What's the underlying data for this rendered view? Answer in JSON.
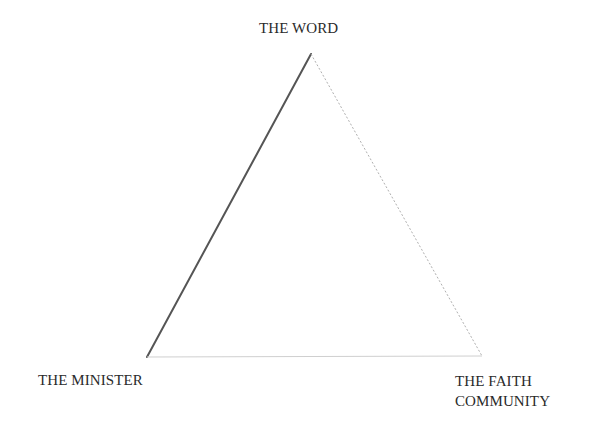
{
  "diagram": {
    "type": "triangle",
    "vertices": {
      "top": {
        "label": "THE WORD",
        "x": 311,
        "y": 54
      },
      "bottom_left": {
        "label": "THE MINISTER",
        "x": 147,
        "y": 357
      },
      "bottom_right": {
        "label_lines": [
          "THE FAITH",
          "COMMUNITY"
        ],
        "x": 482,
        "y": 356
      }
    },
    "edges": [
      {
        "from": "bottom_left",
        "to": "top",
        "style": "solid",
        "color": "#555555",
        "width": 2
      },
      {
        "from": "top",
        "to": "bottom_right",
        "style": "dotted",
        "color": "#b0b0b0",
        "width": 1
      },
      {
        "from": "bottom_left",
        "to": "bottom_right",
        "style": "solid",
        "color": "#cfcfcf",
        "width": 1
      }
    ]
  },
  "labels": {
    "top": "THE WORD",
    "left": "THE MINISTER",
    "right_line1": "THE FAITH",
    "right_line2": "COMMUNITY"
  }
}
